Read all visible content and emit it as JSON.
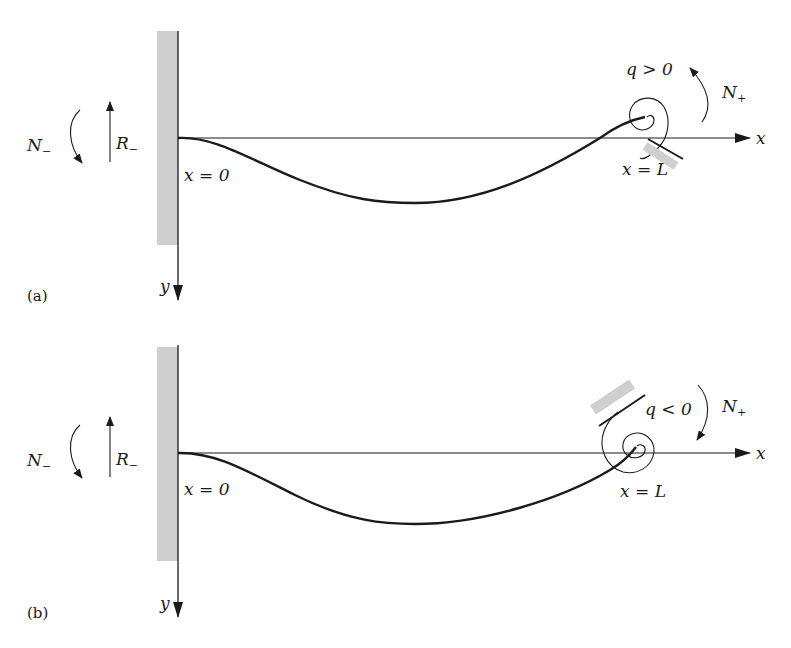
{
  "figure": {
    "panels": [
      {
        "id": "a",
        "panel_label": "(a)",
        "left_moment": "N",
        "left_moment_sub": "−",
        "left_reaction": "R",
        "left_reaction_sub": "−",
        "origin_label": "x = 0",
        "end_label": "x = L",
        "spring_label": "q > 0",
        "right_moment": "N",
        "right_moment_sub": "+",
        "x_axis": "x",
        "y_axis": "y"
      },
      {
        "id": "b",
        "panel_label": "(b)",
        "left_moment": "N",
        "left_moment_sub": "−",
        "left_reaction": "R",
        "left_reaction_sub": "−",
        "origin_label": "x = 0",
        "end_label": "x = L",
        "spring_label": "q < 0",
        "right_moment": "N",
        "right_moment_sub": "+",
        "x_axis": "x",
        "y_axis": "y"
      }
    ],
    "colors": {
      "line": "#1a1a1a",
      "wall": "#cfcfcf"
    }
  }
}
